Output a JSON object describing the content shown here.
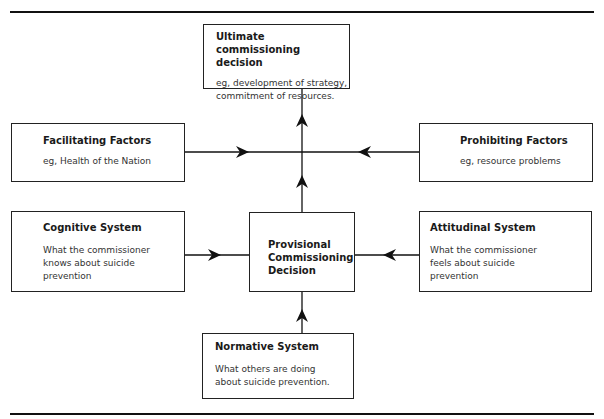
{
  "diagram": {
    "boxes": {
      "ultimate": {
        "title": "Ultimate commissioning decision",
        "body_lines": [
          "eg, development of strategy,",
          "commitment of resources."
        ]
      },
      "facilitating": {
        "title": "Facilitating Factors",
        "body_lines": [
          "eg, Health of the Nation"
        ]
      },
      "prohibiting": {
        "title": "Prohibiting Factors",
        "body_lines": [
          "eg, resource problems"
        ]
      },
      "cognitive": {
        "title": "Cognitive System",
        "body_lines": [
          "What the commissioner",
          "knows about suicide",
          "prevention"
        ]
      },
      "provisional": {
        "title_lines": [
          "Provisional",
          "Commissioning",
          "Decision"
        ]
      },
      "attitudinal": {
        "title": "Attitudinal System",
        "body_lines": [
          "What the commissioner",
          "feels about suicide",
          "prevention"
        ]
      },
      "normative": {
        "title": "Normative System",
        "body_lines": [
          "What others are doing",
          "about suicide prevention."
        ]
      }
    },
    "edges": [
      {
        "from": "facilitating",
        "to": "center-axis"
      },
      {
        "from": "prohibiting",
        "to": "center-axis"
      },
      {
        "from": "provisional",
        "to": "ultimate"
      },
      {
        "from": "cognitive",
        "to": "provisional"
      },
      {
        "from": "attitudinal",
        "to": "provisional"
      },
      {
        "from": "normative",
        "to": "provisional"
      }
    ]
  }
}
